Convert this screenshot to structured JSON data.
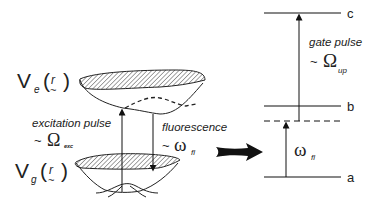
{
  "diagram": {
    "left_panel": {
      "excited_potential_label": {
        "main": "V",
        "sub": "e",
        "arg": "r",
        "tilde": "~"
      },
      "ground_potential_label": {
        "main": "V",
        "sub": "g",
        "arg": "r",
        "tilde": "~"
      },
      "excitation": {
        "label": "excitation pulse",
        "prefix": "~",
        "symbol": "Ω",
        "sub": "exc"
      },
      "fluorescence": {
        "label": "fluorescence",
        "prefix": "~",
        "symbol": "ω",
        "sub": "fl"
      }
    },
    "transition_arrow": {
      "direction": "right"
    },
    "right_panel": {
      "levels": [
        {
          "name": "c",
          "y": 13
        },
        {
          "name": "b",
          "y": 106
        },
        {
          "name": "virtual",
          "y": 121,
          "dashed": true
        },
        {
          "name": "a",
          "y": 177
        }
      ],
      "gate": {
        "label": "gate pulse",
        "prefix": "~",
        "symbol": "Ω",
        "sub": "up"
      },
      "fluor": {
        "symbol": "ω",
        "sub": "fl"
      }
    }
  }
}
